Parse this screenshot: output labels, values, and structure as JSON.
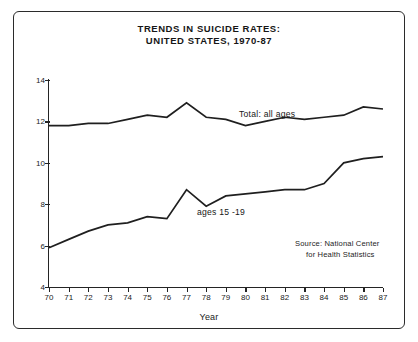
{
  "figure": {
    "title_line1": "TRENDS IN SUICIDE RATES:",
    "title_line2": "UNITED STATES, 1970-87"
  },
  "annotations": {
    "total_label": "Total: all ages",
    "teen_label": "ages 15 -19",
    "source_line1": "Source: National Center",
    "source_line2": "for Health Statistics"
  },
  "chart_data": {
    "type": "line",
    "title": "TRENDS IN SUICIDE RATES: UNITED STATES, 1970-87",
    "xlabel": "Year",
    "ylabel": "Deaths per 100,000 population",
    "xlim": [
      70,
      87
    ],
    "ylim": [
      4,
      14
    ],
    "yticks": [
      4,
      6,
      8,
      10,
      12,
      14
    ],
    "ytick_labels": [
      "4",
      "6",
      "8",
      "10",
      "12",
      "14"
    ],
    "x": [
      70,
      71,
      72,
      73,
      74,
      75,
      76,
      77,
      78,
      79,
      80,
      81,
      82,
      83,
      84,
      85,
      86,
      87
    ],
    "xtick_labels": [
      "70",
      "71",
      "72",
      "73",
      "74",
      "75",
      "76",
      "77",
      "78",
      "79",
      "80",
      "81",
      "82",
      "83",
      "84",
      "85",
      "86",
      "87"
    ],
    "grid": false,
    "legend": "inline annotations",
    "series": [
      {
        "name": "Total: all ages",
        "values": [
          11.8,
          11.8,
          11.9,
          11.9,
          12.1,
          12.3,
          12.2,
          12.9,
          12.2,
          12.1,
          11.8,
          12.0,
          12.2,
          12.1,
          12.2,
          12.3,
          12.7,
          12.6
        ]
      },
      {
        "name": "ages 15 -19",
        "values": [
          5.9,
          6.3,
          6.7,
          7.0,
          7.1,
          7.4,
          7.3,
          8.7,
          7.9,
          8.4,
          8.5,
          8.6,
          8.7,
          8.7,
          9.0,
          10.0,
          10.2,
          10.3
        ]
      }
    ]
  }
}
